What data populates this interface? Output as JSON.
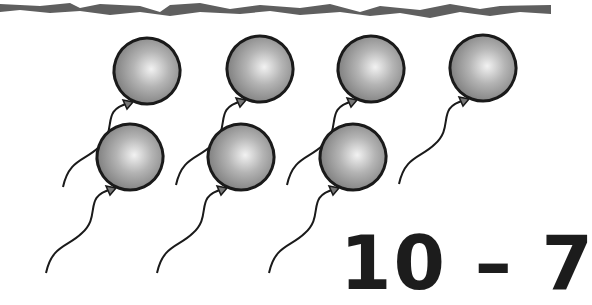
{
  "worksheet": {
    "expression": "10 – 7",
    "minuend": 10,
    "subtrahend": 7,
    "operator": "–",
    "balloon_count": 7,
    "balloon_color": "#8a8a8a",
    "outline_color": "#1a1a1a",
    "border_color": "#5a5a5a"
  },
  "balloons": [
    {
      "row": 1,
      "cx": 147,
      "cy": 71
    },
    {
      "row": 1,
      "cx": 260,
      "cy": 69
    },
    {
      "row": 1,
      "cx": 371,
      "cy": 69
    },
    {
      "row": 1,
      "cx": 483,
      "cy": 68
    },
    {
      "row": 2,
      "cx": 130,
      "cy": 157
    },
    {
      "row": 2,
      "cx": 241,
      "cy": 157
    },
    {
      "row": 2,
      "cx": 353,
      "cy": 157
    }
  ]
}
